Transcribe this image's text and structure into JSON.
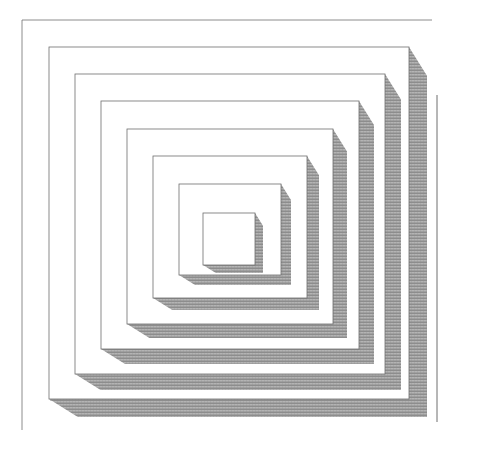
{
  "illustration": {
    "subject": "nested-squares-with-hatched-shadows",
    "background": "#ffffff",
    "line_color": "#6e6e6e",
    "shadow_color": "#9a9a9a",
    "frame": {
      "x1": 22,
      "y1": 20,
      "x2": 432,
      "y2": 430
    },
    "outer_right_line": {
      "x": 437,
      "y1": 95,
      "y2": 422
    },
    "squares": [
      {
        "x": 49,
        "y": 47,
        "w": 360,
        "h": 352,
        "depth": 18
      },
      {
        "x": 75,
        "y": 74,
        "w": 310,
        "h": 300,
        "depth": 16
      },
      {
        "x": 101,
        "y": 101,
        "w": 258,
        "h": 248,
        "depth": 15
      },
      {
        "x": 127,
        "y": 129,
        "w": 206,
        "h": 195,
        "depth": 14
      },
      {
        "x": 153,
        "y": 156,
        "w": 154,
        "h": 142,
        "depth": 12
      },
      {
        "x": 179,
        "y": 184,
        "w": 102,
        "h": 91,
        "depth": 10
      },
      {
        "x": 203,
        "y": 213,
        "w": 52,
        "h": 52,
        "depth": 8
      }
    ]
  }
}
